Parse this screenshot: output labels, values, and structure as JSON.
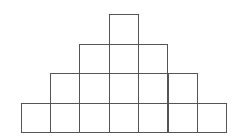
{
  "diagram": {
    "type": "square-pyramid-grid",
    "rows_top_to_bottom": [
      1,
      3,
      5,
      7
    ],
    "total_squares": 16,
    "line_color": "#555555",
    "background": "#ffffff",
    "cell_size_px": 29.4,
    "origin_x_px": 20.5,
    "bottom_y_px": 132
  }
}
